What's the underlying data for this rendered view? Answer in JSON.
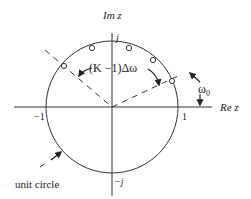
{
  "diagram": {
    "type": "unit-circle-z-plane",
    "labels": {
      "imag_axis": "Im z",
      "real_axis": "Re z",
      "j": "j",
      "minus_j": "−j",
      "minus_one": "−1",
      "one": "1",
      "spacing": "(K −1)Δω",
      "omega0": "ω",
      "omega0_sub": "0",
      "unit_circle": "unit circle"
    },
    "colors": {
      "line": "#333333",
      "text": "#222222",
      "background": "#ffffff"
    },
    "sample_points_count": 5
  }
}
